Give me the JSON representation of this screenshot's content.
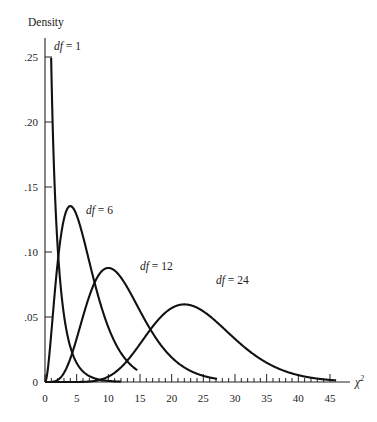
{
  "chart_data": {
    "type": "line",
    "title": "",
    "xlabel": "χ²",
    "ylabel": "Density",
    "xlim": [
      0,
      45
    ],
    "ylim": [
      0,
      0.26
    ],
    "grid": false,
    "legend": "inline labels",
    "x_ticks": [
      0,
      5,
      10,
      15,
      20,
      25,
      30,
      35,
      40,
      45
    ],
    "x_tick_labels": [
      "0",
      "5",
      "10",
      "15",
      "20",
      "25",
      "30",
      "35",
      "40",
      "45"
    ],
    "y_ticks": [
      0,
      0.05,
      0.1,
      0.15,
      0.2,
      0.25
    ],
    "y_tick_labels": [
      "0",
      ".05",
      ".10",
      ".15",
      ".20",
      ".25"
    ],
    "series": [
      {
        "name": "df = 1",
        "df": 1,
        "label_df": "df",
        "label_value": "= 1",
        "peak": {
          "x": 0.3,
          "y": 0.26
        }
      },
      {
        "name": "df = 6",
        "df": 6,
        "label_df": "df",
        "label_value": "= 6",
        "peak": {
          "x": 4,
          "y": 0.135
        }
      },
      {
        "name": "df = 12",
        "df": 12,
        "label_df": "df",
        "label_value": "= 12",
        "peak": {
          "x": 10,
          "y": 0.088
        }
      },
      {
        "name": "df = 24",
        "df": 24,
        "label_df": "df",
        "label_value": "= 24",
        "peak": {
          "x": 22,
          "y": 0.059
        }
      }
    ]
  }
}
